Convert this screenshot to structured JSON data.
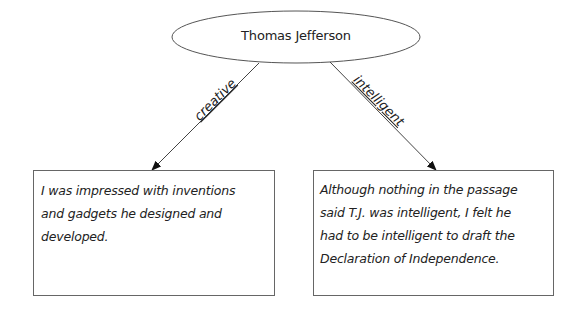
{
  "central_node": {
    "label": "Thomas Jefferson",
    "shape": "ellipse"
  },
  "edges": [
    {
      "label": "creative",
      "from": "central_node",
      "to": "left_box"
    },
    {
      "label": "intelligent",
      "from": "central_node",
      "to": "right_box"
    }
  ],
  "boxes": {
    "left_box": {
      "lines": [
        "I was impressed with inventions",
        "and gadgets he designed and",
        "developed."
      ]
    },
    "right_box": {
      "lines": [
        "Although nothing in the passage",
        "said T.J. was intelligent, I felt he",
        "had to be intelligent to draft the",
        "Declaration of Independence."
      ]
    }
  },
  "colors": {
    "stroke": "#444444",
    "text": "#222222",
    "background": "#ffffff"
  }
}
